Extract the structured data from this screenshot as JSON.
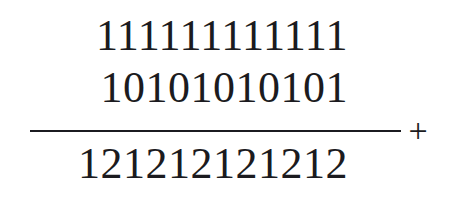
{
  "problem": {
    "type": "vertical-addition",
    "augend": "111111111111",
    "addend": "10101010101",
    "operator": "+",
    "sum": "121212121212",
    "digit_counts": {
      "augend": 12,
      "addend": 11,
      "sum": 12
    },
    "colors": {
      "ink": "#1b1b20",
      "paper": "#ffffff"
    }
  }
}
